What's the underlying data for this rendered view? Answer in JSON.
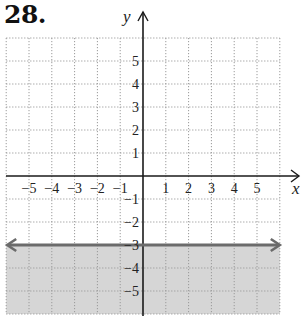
{
  "problem_number": "28.",
  "chart_data": {
    "type": "line",
    "title": "",
    "xlabel": "x",
    "ylabel": "y",
    "xlim": [
      -6,
      6
    ],
    "ylim": [
      -6,
      6
    ],
    "grid": true,
    "grid_style": "dotted",
    "x_ticks": [
      -5,
      -4,
      -3,
      -2,
      -1,
      1,
      2,
      3,
      4,
      5
    ],
    "y_ticks": [
      -5,
      -4,
      -3,
      -2,
      -1,
      1,
      2,
      3,
      4,
      5
    ],
    "x_tick_labels": [
      "−5",
      "−4",
      "−3",
      "−2",
      "−1",
      "1",
      "2",
      "3",
      "4",
      "5"
    ],
    "y_tick_labels": [
      "−5",
      "−4",
      "−3",
      "−2",
      "−1",
      "1",
      "2",
      "3",
      "4",
      "5"
    ],
    "series": [
      {
        "name": "boundary line y = -3",
        "kind": "horizontal_line",
        "y": -3,
        "style": "solid",
        "arrows": "both",
        "color": "#6b6b6b"
      }
    ],
    "shaded_region": {
      "description": "y <= -3 (region below the line)",
      "y_from": -6,
      "y_to": -3,
      "color": "#d6d6d6"
    },
    "colors": {
      "axis": "#1a1a1a",
      "grid": "#9a9a9a",
      "boundary": "#6b6b6b",
      "shade": "#d6d6d6"
    }
  }
}
